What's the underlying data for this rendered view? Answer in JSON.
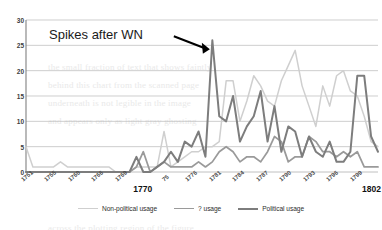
{
  "chart_data": {
    "type": "line",
    "title": "",
    "xlabel": "",
    "ylabel": "",
    "ylim": [
      0,
      30
    ],
    "yticks": [
      0,
      5,
      10,
      15,
      20,
      25,
      30
    ],
    "grid": true,
    "legend_position": "bottom",
    "annotations": [
      {
        "text": "Spikes after WN",
        "arrow": "points right-down to the 1778 peak (~26)"
      }
    ],
    "x": [
      1751,
      1752,
      1753,
      1754,
      1755,
      1756,
      1757,
      1758,
      1759,
      1760,
      1761,
      1762,
      1763,
      1764,
      1765,
      1766,
      1767,
      1768,
      1769,
      1770,
      1771,
      1772,
      1773,
      1774,
      1775,
      1776,
      1777,
      1778,
      1779,
      1780,
      1781,
      1782,
      1783,
      1784,
      1785,
      1786,
      1787,
      1788,
      1789,
      1790,
      1791,
      1792,
      1793,
      1794,
      1795,
      1796,
      1797,
      1798,
      1799,
      1800,
      1801,
      1802
    ],
    "xtick_labels": [
      "1751",
      "1755",
      "1760",
      "1766",
      "1769",
      "1770",
      "75",
      "1776",
      "1781",
      "1784",
      "1787",
      "1790",
      "1793",
      "1796",
      "1799",
      "1802"
    ],
    "xtick_major": [
      "1770",
      "1802"
    ],
    "series": [
      {
        "name": "Non-political usage",
        "color": "#cfcfcf",
        "values": [
          5,
          1,
          1,
          1,
          1,
          2,
          1,
          1,
          1,
          1,
          1,
          1,
          1,
          0,
          0,
          0,
          1,
          1,
          1,
          1,
          8,
          1,
          2,
          3,
          4,
          4,
          5,
          5,
          6,
          18,
          18,
          10,
          14,
          19,
          17,
          14,
          13,
          18,
          21,
          24,
          17,
          13,
          9,
          17,
          13,
          19,
          20,
          16,
          15,
          11,
          6,
          5
        ]
      },
      {
        "name": "? usage",
        "color": "#9a9a9a",
        "values": [
          0,
          0,
          0,
          0,
          0,
          0,
          0,
          0,
          0,
          0,
          0,
          0,
          0,
          0,
          0,
          0,
          1,
          4,
          0,
          1,
          2,
          1,
          1,
          1,
          1,
          2,
          1,
          2,
          4,
          5,
          4,
          2,
          3,
          3,
          2,
          4,
          7,
          6,
          2,
          3,
          3,
          7,
          6,
          4,
          4,
          3,
          4,
          3,
          4,
          1,
          1,
          1
        ]
      },
      {
        "name": "Political usage",
        "color": "#7d7d7d",
        "values": [
          0,
          0,
          0,
          0,
          0,
          0,
          0,
          0,
          0,
          0,
          0,
          0,
          0,
          0,
          0,
          0,
          3,
          0,
          0,
          1,
          2,
          4,
          2,
          6,
          5,
          8,
          3,
          26,
          11,
          10,
          15,
          6,
          9,
          11,
          16,
          6,
          13,
          4,
          9,
          8,
          3,
          7,
          4,
          3,
          6,
          2,
          2,
          4,
          19,
          19,
          7,
          4
        ]
      }
    ]
  },
  "legend": {
    "items": [
      {
        "label": "Non-political usage",
        "color": "#cfcfcf",
        "width": "1.6px"
      },
      {
        "label": "? usage",
        "color": "#9a9a9a",
        "width": "1.8px"
      },
      {
        "label": "Political usage",
        "color": "#7d7d7d",
        "width": "2.0px"
      }
    ]
  },
  "background_text": {
    "lines": [
      {
        "text": "the small fraction of text that shows faintly",
        "x": 48,
        "y": 62
      },
      {
        "text": "behind this chart from the scanned page",
        "x": 48,
        "y": 80
      },
      {
        "text": "underneath is not legible in the image",
        "x": 48,
        "y": 98
      },
      {
        "text": "and appears only as light gray ghosting",
        "x": 48,
        "y": 116
      },
      {
        "text": "across the plotting region of the figure",
        "x": 48,
        "y": 223
      }
    ]
  }
}
